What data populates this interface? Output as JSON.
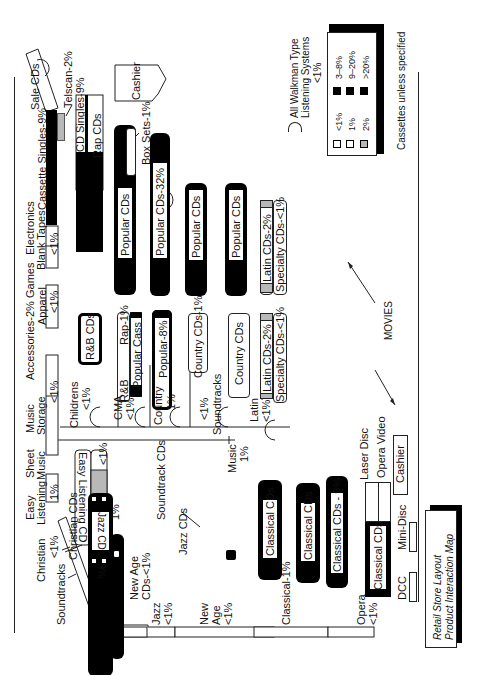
{
  "title": {
    "line1": "Retail Store Layout",
    "line2": "Product Interaction Map"
  },
  "legend": {
    "items": [
      {
        "swatch": "white",
        "label": "<1%"
      },
      {
        "swatch": "white",
        "label": "1%"
      },
      {
        "swatch": "gray",
        "label": "2%"
      },
      {
        "swatch": "black",
        "label": "3–8%"
      },
      {
        "swatch": "black",
        "label": "9–20%"
      },
      {
        "swatch": "black",
        "label": ">20%"
      }
    ],
    "note": "Cassettes unless specified",
    "walkman": {
      "line1": "All Walkman Type",
      "line2": "Listening Systems",
      "line3": "<1%"
    }
  },
  "wall": {
    "sale_cds": "Sale CDs",
    "telscan": "Telscan-2%",
    "cassette_singles": "Cassette Singles-9%",
    "electronics": "Electronics",
    "blank_tapes": "Blank Tapes",
    "blank_tapes_pct": "<1%",
    "games": "Games",
    "apparel": "Apparel",
    "apparel_pct": "<1%",
    "accessories": "Accessories-2%",
    "music_storage_1": "Music",
    "music_storage_2": "Storage",
    "music_storage_pct": "<1%",
    "sheet_music_1": "Sheet",
    "sheet_music_2": "Music",
    "easy_listening_1": "Easy",
    "easy_listening_2": "Listening",
    "easy_listening_pct": "1%",
    "christian": "Christian",
    "christian_pct": "<1%",
    "soundtracks": "Soundtracks"
  },
  "bottom_wall": {
    "jazz": "Jazz",
    "jazz_pct": "<1%",
    "new_age_1": "New",
    "new_age_2": "Age",
    "new_age_pct": "<1%",
    "classical": "Classical-1%",
    "opera": "Opera",
    "opera_pct": "<1%"
  },
  "fixtures": {
    "cd_singles": "CD Singles-9%",
    "rap_cds": "Rap CDs",
    "cashier_top": "Cashier",
    "box_sets": "Box Sets-1%",
    "popular_cds_1": "Popular CDs",
    "popular_cds_32": "Popular CDs-32%",
    "popular_cds_3": "Popular CDs",
    "popular_cds_4": "Popular CDs",
    "latin_cds_a": "Latin CDs-2%",
    "specialty_cds_a": "Specialty CDs-<1%",
    "rnb_cds": "R&B CDs",
    "rnb": "R&B",
    "rap_1": "Rap-1%",
    "popular_cass": "Popular Cass",
    "popular_8": "Popular-8%",
    "country_cds_1": "Country CDs-1%",
    "country_cds": "Country CDs",
    "latin_cds_b": "Latin CDs-2%",
    "specialty_cds_b": "Specialty CDs-<1%",
    "childrens": "Childrens",
    "childrens_pct": "<1%",
    "cma": "CMA",
    "cma_pct": "<1%",
    "country": "Country",
    "country_pct": "1%",
    "soundtracks_mid": "Soundtracks",
    "soundtracks_mid_pct": "<1%",
    "latin": "Latin",
    "latin_pct": "<1%",
    "music": "Music",
    "music_pct": "1%",
    "easy_listening_cd": "Easy Listening CD",
    "easy_listening_cd_pct": "<1%",
    "christian_cds": "Christian CDs",
    "soundtrack_cds": "Soundtrack CDs",
    "soundtrack_cds_pct": "1%",
    "jazz_cds_9": "Jazz CDs - 9%",
    "new_age_cds_1": "New Age",
    "new_age_cds_2": "CDs-<1%",
    "jazz_cds": "Jazz CDs",
    "classical_cds_1": "Classical CDs",
    "classical_cds_2": "Classical CDs",
    "classical_cds_9": "Classical CDs - 9%",
    "classical_cds_4": "Classical CDs",
    "laser_disc": "Laser Disc",
    "opera_video": "Opera Video",
    "cashier_bottom": "Cashier",
    "mini_disc": "Mini-Disc",
    "dcc": "DCC",
    "movies": "MOVIES"
  }
}
